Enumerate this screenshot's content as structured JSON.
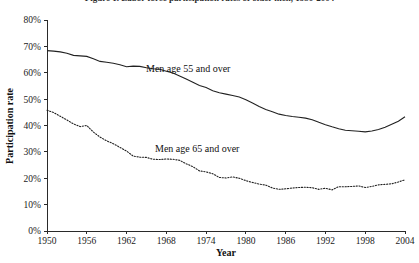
{
  "figure": {
    "clipped_header": "Figure 1. Labor force participation rates of older men, 1950-2004"
  },
  "chart_data": {
    "type": "line",
    "title": "",
    "xlabel": "Year",
    "ylabel": "Participation rate",
    "xlim": [
      1950,
      2004
    ],
    "ylim": [
      0,
      80
    ],
    "grid": false,
    "legend_position": "inline-annotation",
    "xticks": [
      1950,
      1956,
      1962,
      1968,
      1974,
      1980,
      1986,
      1992,
      1998,
      2004
    ],
    "xtick_labels": [
      "1950",
      "1956",
      "1962",
      "1968",
      "1974",
      "1980",
      "1986",
      "1992",
      "1998",
      "2004"
    ],
    "yticks": [
      0,
      10,
      20,
      30,
      40,
      50,
      60,
      70,
      80
    ],
    "ytick_labels": [
      "0%",
      "10%",
      "20%",
      "30%",
      "40%",
      "50%",
      "60%",
      "70%",
      "80%"
    ],
    "x": [
      1950,
      1951,
      1952,
      1953,
      1954,
      1955,
      1956,
      1957,
      1958,
      1959,
      1960,
      1961,
      1962,
      1963,
      1964,
      1965,
      1966,
      1967,
      1968,
      1969,
      1970,
      1971,
      1972,
      1973,
      1974,
      1975,
      1976,
      1977,
      1978,
      1979,
      1980,
      1981,
      1982,
      1983,
      1984,
      1985,
      1986,
      1987,
      1988,
      1989,
      1990,
      1991,
      1992,
      1993,
      1994,
      1995,
      1996,
      1997,
      1998,
      1999,
      2000,
      2001,
      2002,
      2003,
      2004
    ],
    "series": [
      {
        "name": "Men age 55 and over",
        "style": "solid",
        "color": "#222222",
        "label_text": "Men age 55 and over",
        "values": [
          68.4,
          68.2,
          67.9,
          67.4,
          66.6,
          66.4,
          66.2,
          65.3,
          64.3,
          64.0,
          63.6,
          63.0,
          62.3,
          62.5,
          62.4,
          61.9,
          61.5,
          61.3,
          60.6,
          59.9,
          58.8,
          57.6,
          56.4,
          55.2,
          54.4,
          53.2,
          52.4,
          51.9,
          51.4,
          50.8,
          49.8,
          48.5,
          47.2,
          46.1,
          45.2,
          44.3,
          43.8,
          43.4,
          43.1,
          42.8,
          42.2,
          41.2,
          40.3,
          39.5,
          38.8,
          38.2,
          38.0,
          37.8,
          37.6,
          37.9,
          38.5,
          39.3,
          40.5,
          41.6,
          43.3
        ]
      },
      {
        "name": "Men age 65 and over",
        "style": "dotted",
        "color": "#222222",
        "label_text": "Men age 65 and over",
        "values": [
          45.8,
          44.9,
          43.5,
          42.1,
          40.6,
          39.6,
          40.0,
          37.5,
          35.6,
          34.2,
          33.1,
          31.7,
          30.3,
          28.4,
          28.0,
          27.9,
          27.2,
          27.1,
          27.3,
          27.2,
          26.8,
          25.5,
          24.4,
          22.8,
          22.4,
          21.7,
          20.3,
          20.1,
          20.5,
          20.0,
          19.1,
          18.4,
          17.8,
          17.4,
          16.3,
          15.8,
          16.0,
          16.3,
          16.5,
          16.6,
          16.4,
          15.8,
          16.2,
          15.6,
          16.8,
          16.8,
          16.9,
          17.1,
          16.5,
          16.9,
          17.5,
          17.7,
          17.9,
          18.6,
          19.4
        ]
      }
    ]
  }
}
